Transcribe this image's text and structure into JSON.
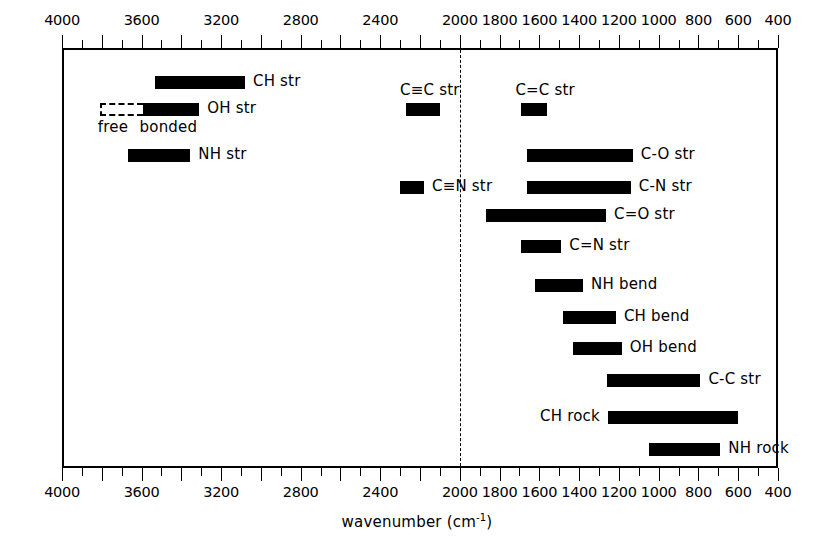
{
  "chart_data": {
    "type": "bar",
    "orientation": "horizontal-ranges",
    "title": "",
    "xlabel": "wavenumber (cm-1)",
    "xlabel_html": "wavenumber (cm<sup>-1</sup>)",
    "ylabel": "",
    "xlim": [
      4000,
      400
    ],
    "x_axis_reversed": true,
    "tick_labels": [
      "4000",
      "3600",
      "3200",
      "2800",
      "2400",
      "2000",
      "1800",
      "1600",
      "1400",
      "1200",
      "1000",
      "800",
      "600",
      "400"
    ],
    "tick_values": [
      4000,
      3600,
      3200,
      2800,
      2400,
      2000,
      1800,
      1600,
      1400,
      1200,
      1000,
      800,
      600,
      400
    ],
    "minor_tick_step": 100,
    "major_tick_step": 200,
    "grid": false,
    "legend": "none",
    "annotations": [
      {
        "name": "divider-2000",
        "type": "vertical-dashed-line",
        "x": 2000
      }
    ],
    "bands": [
      {
        "label": "CH str",
        "start": 3530,
        "end": 3080,
        "row": 0,
        "label_side": "right",
        "style": "solid"
      },
      {
        "label": "OH str",
        "start": 3810,
        "end": 3310,
        "row": 1,
        "label_side": "right",
        "style": "split",
        "free_start": 3810,
        "free_end": 3595,
        "bonded_start": 3595,
        "bonded_end": 3310,
        "sublabels": [
          "free",
          "bonded"
        ]
      },
      {
        "label": "NH str",
        "start": 3670,
        "end": 3355,
        "row": 2,
        "label_side": "right",
        "style": "solid"
      },
      {
        "label": "C≡C str",
        "start": 2270,
        "end": 2100,
        "row": 1,
        "label_side": "above",
        "style": "solid"
      },
      {
        "label": "C=C str",
        "start": 1690,
        "end": 1560,
        "row": 1,
        "label_side": "above",
        "style": "solid"
      },
      {
        "label": "C≡N str",
        "start": 2300,
        "end": 2180,
        "row": 3,
        "label_side": "right",
        "style": "solid"
      },
      {
        "label": "C-O str",
        "start": 1660,
        "end": 1130,
        "row": 2,
        "label_side": "right",
        "style": "solid"
      },
      {
        "label": "C-N str",
        "start": 1660,
        "end": 1140,
        "row": 3,
        "label_side": "right",
        "style": "solid"
      },
      {
        "label": "C=O str",
        "start": 1870,
        "end": 1265,
        "row": 4,
        "label_side": "right",
        "style": "solid"
      },
      {
        "label": "C=N str",
        "start": 1690,
        "end": 1490,
        "row": 5,
        "label_side": "right",
        "style": "solid"
      },
      {
        "label": "NH bend",
        "start": 1620,
        "end": 1380,
        "row": 6,
        "label_side": "right",
        "style": "solid"
      },
      {
        "label": "CH bend",
        "start": 1480,
        "end": 1215,
        "row": 7,
        "label_side": "right",
        "style": "solid"
      },
      {
        "label": "OH bend",
        "start": 1430,
        "end": 1185,
        "row": 8,
        "label_side": "right",
        "style": "solid"
      },
      {
        "label": "C-C str",
        "start": 1260,
        "end": 790,
        "row": 9,
        "label_side": "right",
        "style": "solid"
      },
      {
        "label": "CH rock",
        "start": 1255,
        "end": 600,
        "row": 10,
        "label_side": "left",
        "style": "solid"
      },
      {
        "label": "NH rock",
        "start": 1050,
        "end": 690,
        "row": 11,
        "label_side": "right",
        "style": "solid"
      }
    ]
  },
  "axis": {
    "title_prefix": "wavenumber (cm",
    "title_suffix": ")",
    "title_sup": "-1",
    "title_full": "wavenumber (cm-1)"
  },
  "bands_rows_y": {
    "row0": 76,
    "row1": 103,
    "row2": 149,
    "row3": 181,
    "row4": 209,
    "row5": 240,
    "row6": 279,
    "row7": 311,
    "row8": 342,
    "row9": 374,
    "row10": 411,
    "row11": 443
  },
  "colors": {
    "bar": "#000000",
    "frame": "#000000",
    "background": "#ffffff",
    "divider": "#000000"
  }
}
